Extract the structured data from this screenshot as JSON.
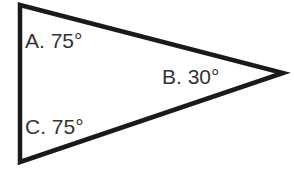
{
  "diagram": {
    "type": "triangle",
    "stroke_color": "#1a1a1a",
    "label_color": "#333333",
    "vertices": [
      {
        "id": "A",
        "label": "A. 75°",
        "angle_deg": 75
      },
      {
        "id": "B",
        "label": "B. 30°",
        "angle_deg": 30
      },
      {
        "id": "C",
        "label": "C. 75°",
        "angle_deg": 75
      }
    ]
  }
}
